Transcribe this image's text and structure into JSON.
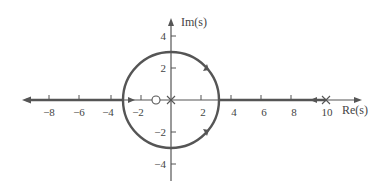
{
  "diagram": {
    "type": "root-locus",
    "axes": {
      "x_label": "Re(s)",
      "y_label": "Im(s)",
      "x_ticks": [
        -8,
        -6,
        -4,
        -2,
        2,
        4,
        6,
        8,
        10
      ],
      "y_ticks": [
        4,
        2,
        -2,
        -4
      ],
      "x_tick_labels": [
        "−8",
        "−6",
        "−4",
        "−2",
        "2",
        "4",
        "6",
        "8",
        "10"
      ],
      "y_tick_labels": [
        "4",
        "2",
        "−2",
        "−4"
      ]
    },
    "poles": [
      {
        "re": 0,
        "im": 0
      },
      {
        "re": 10,
        "im": 0
      }
    ],
    "zeros": [
      {
        "re": -1,
        "im": 0
      }
    ],
    "locus": {
      "circle": {
        "center_re": 0,
        "center_im": 0,
        "radius": 3
      },
      "real_axis_segments": [
        {
          "from": 10,
          "to": 3,
          "direction": "left"
        },
        {
          "from": -3,
          "to": -10,
          "direction": "left"
        }
      ]
    },
    "colors": {
      "axis": "#555555",
      "locus": "#555555",
      "text": "#444444"
    }
  }
}
